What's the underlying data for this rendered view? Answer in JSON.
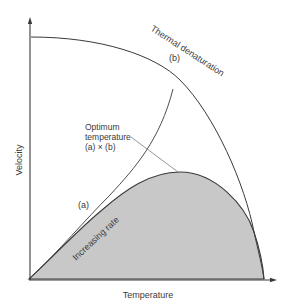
{
  "diagram": {
    "axes": {
      "x_label": "Temperature",
      "y_label": "Velocity"
    },
    "curves": {
      "a": {
        "id": "(a)",
        "label": "Increasing rate"
      },
      "b": {
        "id": "(b)",
        "label": "Thermal denaturation"
      },
      "product": {
        "label_line1": "Optimum",
        "label_line2": "temperature",
        "label_line3": "(a) × (b)"
      }
    },
    "colors": {
      "line": "#3a3a3a",
      "shade": "#c8c8c8",
      "pointer": "#7a7a7a"
    }
  }
}
